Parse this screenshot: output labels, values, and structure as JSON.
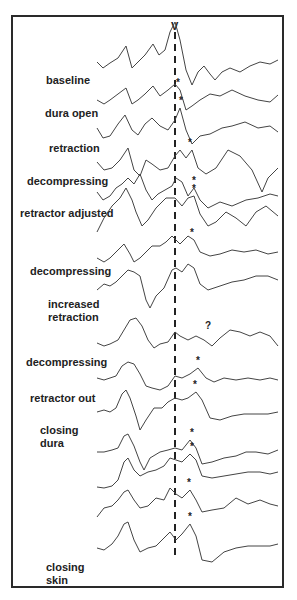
{
  "figure": {
    "peak_label": "V",
    "star_marker": "*",
    "unknown_marker": "?",
    "labels": [
      {
        "text": "baseline",
        "x": 46,
        "y": 74
      },
      {
        "text": "dura open",
        "x": 45,
        "y": 107
      },
      {
        "text": "retraction",
        "x": 49,
        "y": 142
      },
      {
        "text": "decompressing",
        "x": 27,
        "y": 175
      },
      {
        "text": "retractor adjusted",
        "x": 20,
        "y": 207
      },
      {
        "text": "decompressing",
        "x": 30,
        "y": 265
      },
      {
        "text": "increased\nretraction",
        "x": 48,
        "y": 298
      },
      {
        "text": "decompressing",
        "x": 26,
        "y": 356
      },
      {
        "text": "retractor out",
        "x": 30,
        "y": 392
      },
      {
        "text": "closing\ndura",
        "x": 40,
        "y": 424
      },
      {
        "text": "closing\nskin",
        "x": 46,
        "y": 561
      }
    ]
  },
  "chart_data": {
    "type": "line",
    "title": "",
    "xlabel": "",
    "ylabel": "",
    "reference_line": {
      "label": "V",
      "style": "dashed",
      "x": 175
    },
    "series": [
      {
        "name": "baseline",
        "marker": "",
        "marker_x": 0,
        "points": "97,62 103,68 110,63 118,58 126,46 132,68 138,62 145,55 153,44 159,55 165,50 170,32 175,22 180,40 186,70 192,85 198,72 204,66 210,74 215,80 222,72 230,68 240,72 250,66 260,62 270,64 278,60"
      },
      {
        "name": "dura open",
        "marker": "*",
        "marker_x": 178,
        "points": "97,100 104,104 110,100 118,94 126,88 132,104 138,100 145,94 153,86 160,96 168,90 175,84 180,90 186,110 192,106 200,100 210,94 220,96 232,90 245,96 258,100 270,102 278,95"
      },
      {
        "name": "retraction",
        "marker": "*",
        "marker_x": 181,
        "points": "97,128 103,138 110,136 118,124 125,115 132,130 138,135 145,124 152,118 160,126 168,130 175,120 180,108 186,130 192,144 200,136 210,134 222,128 232,126 245,122 258,128 270,126 278,132"
      },
      {
        "name": "decompressing",
        "marker": "*",
        "marker_x": 190,
        "points": "97,162 104,170 112,168 120,160 128,148 134,170 140,176 146,160 152,164 160,170 168,168 175,156 180,150 186,158 192,150 198,168 206,174 216,168 228,150 240,156 252,170 262,192 268,178 278,168"
      },
      {
        "name": "retractor adjusted",
        "marker": "*",
        "marker_x": 194,
        "points": "97,192 103,200 110,196 116,188 122,184 128,178 134,184 140,174 146,190 152,200 158,194 165,190 172,186 176,178 182,182 188,196 194,188 200,200 208,208 220,202 232,206 246,200 258,198 270,194 278,196"
      },
      {
        "name": "trace 6",
        "marker": "*",
        "marker_x": 194,
        "points": "97,232 104,218 112,206 120,198 126,188 132,200 136,212 142,226 148,220 156,208 166,198 175,198 182,206 188,198 194,196 200,214 208,226 216,222 226,212 236,218 246,226 256,212 266,206 278,216"
      },
      {
        "name": "decompressing",
        "marker": "*",
        "marker_x": 192,
        "points": "97,258 104,262 110,258 118,250 124,244 130,254 134,262 140,258 146,252 152,246 160,246 166,242 172,236 176,240 180,244 188,236 194,240 200,252 210,256 220,254 232,250 244,252 256,250 268,254 278,252"
      },
      {
        "name": "trace 8",
        "marker": "",
        "marker_x": 0,
        "points": "97,290 104,284 110,286 116,282 122,276 128,270 134,272 140,276 146,300 150,308 156,296 164,288 172,270 176,268 182,272 188,264 194,268 200,284 208,290 220,286 232,282 244,280 256,276 268,276 278,280"
      },
      {
        "name": "increased retraction",
        "marker": "?",
        "marker_x": 207,
        "points": "97,343 104,346 110,344 118,340 124,330 130,320 136,318 142,326 148,340 154,348 160,344 168,342 175,332 180,336 188,340 196,336 204,340 212,346 220,338 230,330 240,332 250,336 260,332 270,336 278,346"
      },
      {
        "name": "decompressing",
        "marker": "*",
        "marker_x": 198,
        "points": "97,378 104,380 110,378 116,376 122,366 128,362 134,364 140,374 146,386 152,388 160,390 168,386 175,376 182,378 190,374 198,368 206,378 214,382 224,378 236,380 248,378 260,380 270,378 278,380"
      },
      {
        "name": "retractor out",
        "marker": "*",
        "marker_x": 195,
        "points": "97,412 104,410 110,412 116,408 122,394 126,390 130,398 136,416 140,430 146,420 154,408 162,408 168,402 175,398 182,400 188,398 196,392 202,400 210,418 220,420 232,416 244,414 256,414 268,414 278,412"
      },
      {
        "name": "closing dura",
        "marker": "*",
        "marker_x": 192,
        "points": "97,452 104,452 112,450 118,448 124,436 128,434 134,446 140,462 144,470 150,458 160,452 168,450 175,448 182,450 190,440 196,448 202,464 212,462 224,458 236,456 246,452 256,452 268,454 278,450"
      },
      {
        "name": "trace 13",
        "marker": "*",
        "marker_x": 192,
        "points": "97,487 104,488 112,486 118,480 124,462 128,458 134,470 140,476 148,472 156,470 164,466 170,458 176,460 182,462 190,454 196,460 202,476 212,478 224,476 236,474 248,472 260,472 270,474 278,472"
      },
      {
        "name": "trace 14",
        "marker": "*",
        "marker_x": 189,
        "points": "97,517 104,508 112,506 118,500 124,492 128,490 134,500 140,508 148,506 156,498 164,500 170,488 176,494 182,498 190,490 196,500 202,512 212,510 224,508 236,498 248,504 260,500 270,504 278,506"
      },
      {
        "name": "closing skin",
        "marker": "*",
        "marker_x": 190,
        "points": "97,548 104,550 112,544 118,536 124,524 128,522 134,540 140,552 148,548 156,546 164,538 170,532 176,540 182,534 190,524 196,536 202,560 212,562 224,552 236,548 248,546 260,546 270,546 278,544"
      }
    ]
  }
}
